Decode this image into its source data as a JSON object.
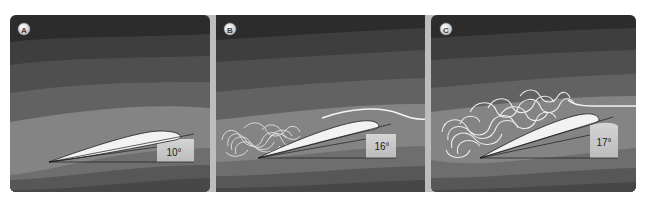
{
  "figure": {
    "colors": {
      "frame": "#b9b9b9",
      "separator": "#bdbdbd",
      "band_darkest": "#2c2c2c",
      "band_dark": "#3e3e3e",
      "band_mid_dark": "#4f4f4f",
      "band_mid": "#626262",
      "band_light": "#848484",
      "band_below_1": "#6e6e6e",
      "band_below_2": "#575757",
      "band_below_3": "#474747",
      "airfoil_fill": "#f2f2f2",
      "airfoil_outline": "#1e1e1e",
      "angle_box": "#c9c9c9",
      "streamline": "#f4f4f4",
      "badge_fill": "#e6e6e6",
      "badge_text": "#3a3a3a"
    },
    "panels": [
      {
        "label": "A",
        "angle": "10°",
        "flow_state": "attached"
      },
      {
        "label": "B",
        "angle": "16°",
        "flow_state": "partial separation"
      },
      {
        "label": "C",
        "angle": "17°",
        "flow_state": "stalled"
      }
    ]
  }
}
